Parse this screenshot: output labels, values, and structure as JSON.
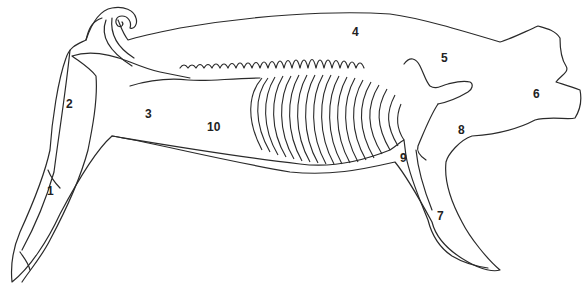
{
  "diagram": {
    "stroke_color": "#2a2a2a",
    "background": "#ffffff",
    "labels": [
      {
        "id": "1",
        "text": "1",
        "x": 47,
        "y": 185
      },
      {
        "id": "2",
        "text": "2",
        "x": 66,
        "y": 98
      },
      {
        "id": "3",
        "text": "3",
        "x": 145,
        "y": 108
      },
      {
        "id": "4",
        "text": "4",
        "x": 352,
        "y": 26
      },
      {
        "id": "5",
        "text": "5",
        "x": 441,
        "y": 52
      },
      {
        "id": "6",
        "text": "6",
        "x": 533,
        "y": 88
      },
      {
        "id": "7",
        "text": "7",
        "x": 437,
        "y": 210
      },
      {
        "id": "8",
        "text": "8",
        "x": 458,
        "y": 124
      },
      {
        "id": "9",
        "text": "9",
        "x": 400,
        "y": 152
      },
      {
        "id": "10",
        "text": "10",
        "x": 207,
        "y": 121
      }
    ]
  }
}
